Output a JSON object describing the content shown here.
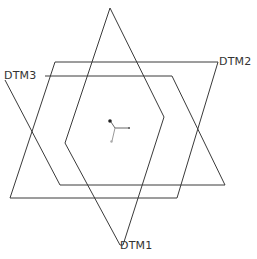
{
  "diagram": {
    "type": "datum-planes",
    "planes": [
      {
        "name": "DTM1",
        "label": "DTM1",
        "points": "110,8 164,117 123,245 120,245 65,143 110,8",
        "label_pos": {
          "x": 118,
          "y": 243
        }
      },
      {
        "name": "DTM2",
        "label": "DTM2",
        "points": "55,62 218,62 177,198 10,198 55,62",
        "label_pos": {
          "x": 218,
          "y": 56
        }
      },
      {
        "name": "DTM3",
        "label": "DTM3",
        "points": "45,76 172,76 225,185 60,185 5,80",
        "label_pos": {
          "x": 4,
          "y": 71
        }
      }
    ],
    "origin": {
      "x": 110,
      "y": 122
    },
    "colors": {
      "line": "#3a3a3a",
      "background": "#ffffff",
      "axis": "#555555"
    }
  }
}
